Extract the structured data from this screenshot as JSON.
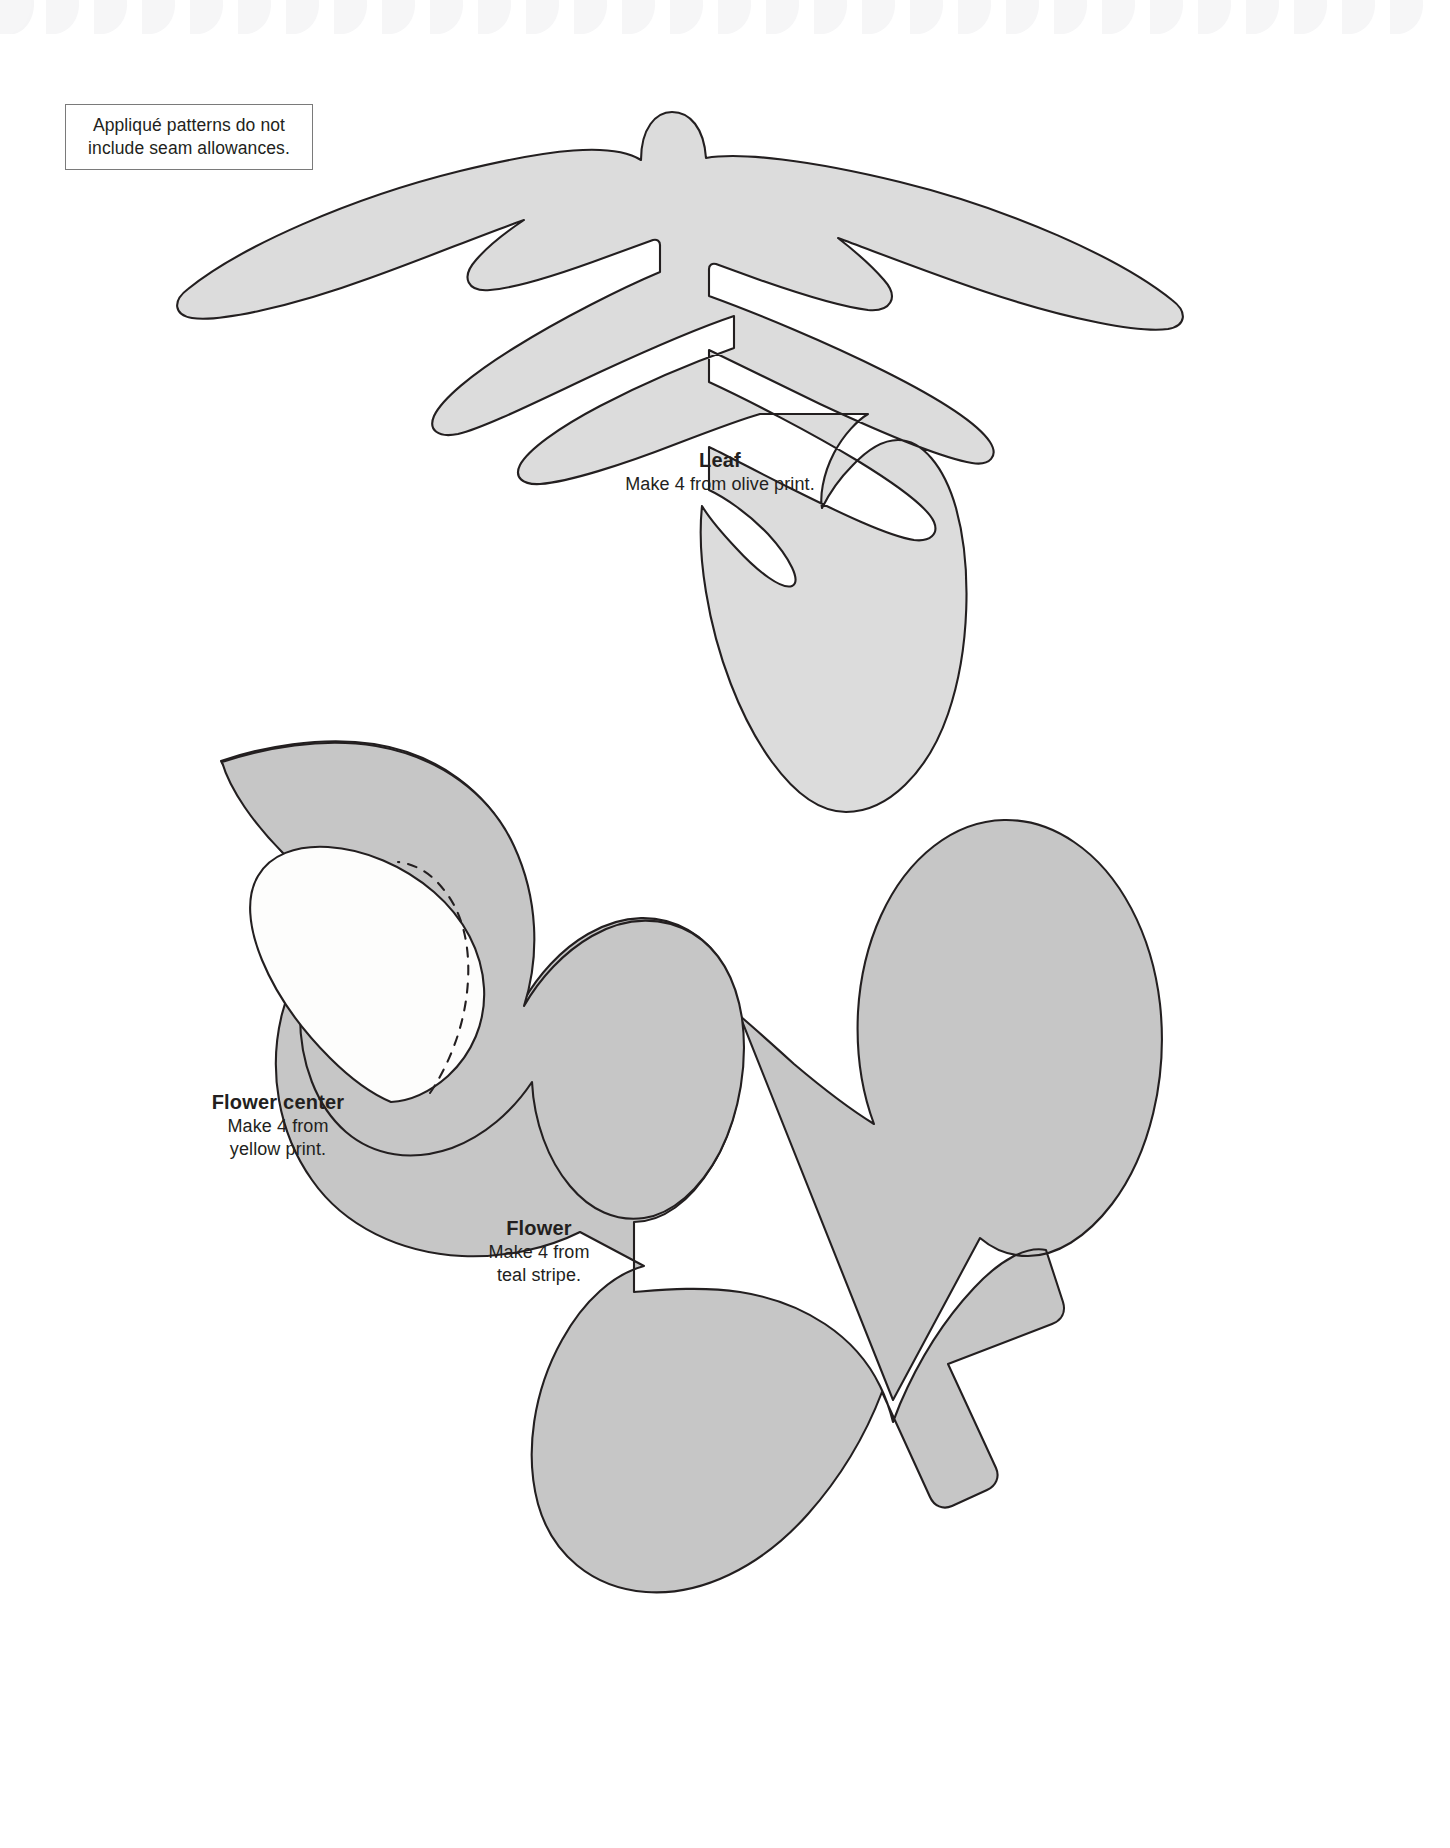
{
  "page": {
    "background_color": "#ffffff",
    "width": 1450,
    "height": 1848
  },
  "top_band": {
    "name": "decorative-border-strip",
    "description": "faint repeating cut-off petal motifs across the top edge",
    "motif_color": "#f6f6f7",
    "repeat_count": 30
  },
  "note": {
    "line1": "Appliqué patterns do not",
    "line2": "include seam allowances.",
    "border_color": "#7a7a7a",
    "text_color": "#231f20"
  },
  "pieces": [
    {
      "id": "leaf",
      "title": "Leaf",
      "instruction": "Make 4 from olive print.",
      "fill": "#dcdcdc",
      "stroke": "#231f20"
    },
    {
      "id": "flower_center",
      "title": "Flower center",
      "instruction_line1": "Make 4 from",
      "instruction_line2": "yellow print.",
      "fill": "#fdfdfc",
      "stroke": "#231f20",
      "hidden_edge_style": "dashed"
    },
    {
      "id": "flower",
      "title": "Flower",
      "instruction_line1": "Make 4 from",
      "instruction_line2": "teal stripe.",
      "fill": "#c6c6c6",
      "stroke": "#231f20"
    }
  ],
  "labels": {
    "leaf_title": "Leaf",
    "leaf_sub": "Make 4 from olive print.",
    "flower_center_title": "Flower center",
    "flower_center_sub1": "Make 4 from",
    "flower_center_sub2": "yellow print.",
    "flower_title": "Flower",
    "flower_sub1": "Make 4 from",
    "flower_sub2": "teal stripe."
  }
}
